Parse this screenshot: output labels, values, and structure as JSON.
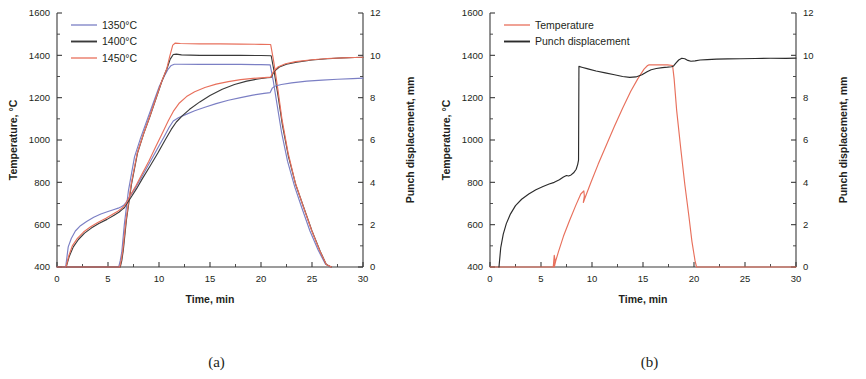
{
  "figure": {
    "panels": [
      {
        "id": "a",
        "caption": "(a)",
        "x_axis": {
          "label": "Time, min",
          "min": 0,
          "max": 30,
          "ticks": [
            0,
            5,
            10,
            15,
            20,
            25,
            30
          ]
        },
        "y_left": {
          "label": "Temperature, °C",
          "min": 400,
          "max": 1600,
          "ticks": [
            400,
            600,
            800,
            1000,
            1200,
            1400,
            1600
          ]
        },
        "y_right": {
          "label": "Punch displacement, mm",
          "min": 0,
          "max": 12,
          "ticks": [
            0,
            2,
            4,
            6,
            8,
            10,
            12
          ]
        },
        "legend": {
          "position": "top-left",
          "entries": [
            {
              "label": "1350°C",
              "color": "#7b7fc4"
            },
            {
              "label": "1400°C",
              "color": "#3a3a3a"
            },
            {
              "label": "1450°C",
              "color": "#e8705c"
            }
          ]
        }
      },
      {
        "id": "b",
        "caption": "(b)",
        "x_axis": {
          "label": "Time, min",
          "min": 0,
          "max": 30,
          "ticks": [
            0,
            5,
            10,
            15,
            20,
            25,
            30
          ]
        },
        "y_left": {
          "label": "Temperature, °C",
          "min": 400,
          "max": 1600,
          "ticks": [
            400,
            600,
            800,
            1000,
            1200,
            1400,
            1600
          ]
        },
        "y_right": {
          "label": "Punch displacement, mm",
          "min": 0,
          "max": 12,
          "ticks": [
            0,
            2,
            4,
            6,
            8,
            10,
            12
          ]
        },
        "legend": {
          "position": "top-left",
          "entries": [
            {
              "label": "Temperature",
              "color": "#e8705c"
            },
            {
              "label": "Punch displacement",
              "color": "#2b2b2b"
            }
          ]
        }
      }
    ]
  },
  "chart_data": [
    {
      "type": "line",
      "panel": "a",
      "title": "",
      "xlabel": "Time, min",
      "ylabel": "Temperature, °C",
      "ylabel_right": "Punch displacement, mm",
      "xlim": [
        0,
        30
      ],
      "ylim": [
        400,
        1600
      ],
      "ylim_right": [
        0,
        12
      ],
      "grid": false,
      "legend_position": "top-left",
      "series": [
        {
          "name": "1350°C temperature",
          "axis": "left",
          "color": "#7b7fc4",
          "x": [
            0,
            6.05,
            6.2,
            6.35,
            6.6,
            7.0,
            7.6,
            8.2,
            8.8,
            9.4,
            10.0,
            10.5,
            10.9,
            11.2,
            11.5,
            12.0,
            14.0,
            16.0,
            18.0,
            20.0,
            20.9,
            21.2,
            21.6,
            22.0,
            22.6,
            23.3,
            24.0,
            24.8,
            25.6,
            26.3,
            26.8
          ],
          "y": [
            400,
            400,
            430,
            470,
            600,
            760,
            920,
            1010,
            1090,
            1170,
            1250,
            1300,
            1335,
            1352,
            1358,
            1358,
            1357,
            1357,
            1357,
            1356,
            1355,
            1280,
            1160,
            1040,
            900,
            780,
            680,
            570,
            480,
            415,
            400
          ]
        },
        {
          "name": "1400°C temperature",
          "axis": "left",
          "color": "#3a3a3a",
          "x": [
            0,
            6.2,
            6.35,
            6.5,
            6.8,
            7.3,
            7.9,
            8.5,
            9.1,
            9.7,
            10.3,
            10.8,
            11.1,
            11.4,
            11.7,
            12.2,
            14.0,
            16.0,
            18.0,
            20.0,
            21.0,
            21.3,
            21.7,
            22.1,
            22.7,
            23.4,
            24.2,
            25.0,
            25.8,
            26.4,
            26.9
          ],
          "y": [
            400,
            400,
            430,
            480,
            620,
            790,
            940,
            1030,
            1110,
            1195,
            1280,
            1340,
            1382,
            1404,
            1406,
            1402,
            1400,
            1400,
            1400,
            1399,
            1398,
            1320,
            1200,
            1070,
            920,
            790,
            680,
            570,
            475,
            412,
            400
          ]
        },
        {
          "name": "1450°C temperature",
          "axis": "left",
          "color": "#e8705c",
          "x": [
            0,
            6.15,
            6.3,
            6.45,
            6.75,
            7.25,
            7.85,
            8.45,
            9.05,
            9.65,
            10.25,
            10.75,
            11.05,
            11.35,
            11.6,
            12.1,
            14.0,
            16.0,
            18.0,
            20.0,
            20.95,
            21.25,
            21.65,
            22.05,
            22.65,
            23.35,
            24.15,
            24.95,
            25.75,
            26.4,
            26.9
          ],
          "y": [
            400,
            400,
            432,
            478,
            615,
            785,
            935,
            1025,
            1105,
            1190,
            1275,
            1335,
            1395,
            1448,
            1458,
            1456,
            1454,
            1454,
            1453,
            1452,
            1451,
            1370,
            1240,
            1100,
            940,
            800,
            685,
            575,
            478,
            412,
            400
          ]
        },
        {
          "name": "1350°C punch displacement",
          "axis": "right",
          "color": "#7b7fc4",
          "x": [
            0.85,
            1.1,
            1.4,
            1.8,
            2.3,
            2.9,
            3.6,
            4.3,
            5.0,
            5.6,
            6.0,
            6.3,
            6.5,
            6.7,
            7.1,
            7.7,
            8.3,
            9.0,
            9.8,
            10.5,
            11.0,
            11.4,
            11.9,
            12.6,
            13.5,
            14.5,
            15.6,
            16.8,
            18.0,
            19.2,
            20.3,
            20.9,
            21.1,
            21.4,
            22.0,
            23.0,
            24.5,
            26.0,
            27.5,
            29.0,
            30.0
          ],
          "y": [
            0.0,
            0.95,
            1.35,
            1.7,
            1.95,
            2.15,
            2.35,
            2.5,
            2.62,
            2.72,
            2.78,
            2.85,
            2.9,
            3.0,
            3.3,
            3.75,
            4.25,
            4.85,
            5.55,
            6.15,
            6.6,
            6.9,
            7.05,
            7.2,
            7.38,
            7.55,
            7.72,
            7.88,
            8.0,
            8.12,
            8.2,
            8.24,
            8.45,
            8.55,
            8.62,
            8.7,
            8.78,
            8.83,
            8.87,
            8.9,
            8.92
          ]
        },
        {
          "name": "1400°C punch displacement",
          "axis": "right",
          "color": "#3a3a3a",
          "x": [
            0.9,
            1.2,
            1.6,
            2.1,
            2.7,
            3.4,
            4.1,
            4.9,
            5.6,
            6.1,
            6.4,
            6.6,
            6.8,
            7.2,
            7.8,
            8.4,
            9.1,
            9.9,
            10.6,
            11.2,
            11.7,
            12.3,
            13.0,
            14.0,
            15.0,
            16.2,
            17.4,
            18.6,
            19.7,
            20.6,
            21.0,
            21.3,
            21.8,
            22.5,
            23.5,
            25.0,
            26.5,
            28.0,
            29.2,
            30.0
          ],
          "y": [
            0.0,
            0.5,
            0.95,
            1.3,
            1.6,
            1.85,
            2.05,
            2.25,
            2.45,
            2.6,
            2.72,
            2.8,
            2.95,
            3.25,
            3.7,
            4.2,
            4.75,
            5.4,
            6.0,
            6.5,
            6.85,
            7.15,
            7.45,
            7.8,
            8.1,
            8.4,
            8.62,
            8.78,
            8.88,
            8.94,
            8.96,
            9.25,
            9.45,
            9.58,
            9.68,
            9.78,
            9.84,
            9.88,
            9.9,
            9.91
          ]
        },
        {
          "name": "1450°C punch displacement",
          "axis": "right",
          "color": "#e8705c",
          "x": [
            0.88,
            1.15,
            1.5,
            2.0,
            2.6,
            3.3,
            4.0,
            4.8,
            5.5,
            6.0,
            6.3,
            6.55,
            6.75,
            7.15,
            7.75,
            8.35,
            9.0,
            9.7,
            10.3,
            10.9,
            11.4,
            12.0,
            12.7,
            13.5,
            14.5,
            15.6,
            16.8,
            18.0,
            19.2,
            20.3,
            20.95,
            21.25,
            21.7,
            22.4,
            23.4,
            25.0,
            26.5,
            28.0,
            29.2,
            30.0
          ],
          "y": [
            0.0,
            0.52,
            1.0,
            1.35,
            1.65,
            1.9,
            2.1,
            2.3,
            2.5,
            2.65,
            2.75,
            2.85,
            3.0,
            3.35,
            3.85,
            4.4,
            5.0,
            5.7,
            6.3,
            6.9,
            7.35,
            7.75,
            8.05,
            8.28,
            8.48,
            8.64,
            8.76,
            8.85,
            8.91,
            8.95,
            8.97,
            9.26,
            9.46,
            9.6,
            9.7,
            9.79,
            9.85,
            9.88,
            9.9,
            9.91
          ]
        }
      ]
    },
    {
      "type": "line",
      "panel": "b",
      "title": "",
      "xlabel": "Time, min",
      "ylabel": "Temperature, °C",
      "ylabel_right": "Punch displacement, mm",
      "xlim": [
        0,
        30
      ],
      "ylim": [
        400,
        1600
      ],
      "ylim_right": [
        0,
        12
      ],
      "grid": false,
      "legend_position": "top-left",
      "series": [
        {
          "name": "Temperature",
          "axis": "left",
          "color": "#e8705c",
          "x": [
            0,
            6.2,
            6.3,
            6.38,
            6.3,
            6.45,
            6.7,
            7.2,
            7.8,
            8.4,
            8.9,
            9.2,
            9.25,
            9.15,
            9.3,
            9.9,
            10.6,
            11.4,
            12.2,
            13.0,
            13.8,
            14.5,
            15.1,
            15.45,
            15.6,
            16.5,
            17.4,
            17.9,
            18.05,
            18.3,
            18.7,
            19.1,
            19.5,
            19.8,
            20.1,
            20.25,
            30
          ],
          "y": [
            400,
            400,
            455,
            430,
            400,
            430,
            470,
            545,
            620,
            690,
            745,
            760,
            735,
            705,
            725,
            800,
            885,
            975,
            1065,
            1150,
            1230,
            1290,
            1335,
            1352,
            1355,
            1355,
            1355,
            1352,
            1290,
            1140,
            960,
            790,
            640,
            520,
            430,
            400,
            400
          ]
        },
        {
          "name": "Punch displacement",
          "axis": "right",
          "color": "#2b2b2b",
          "x": [
            0.88,
            1.05,
            1.3,
            1.6,
            2.0,
            2.5,
            3.1,
            3.8,
            4.5,
            5.2,
            5.8,
            6.3,
            6.8,
            7.2,
            7.5,
            7.7,
            7.95,
            8.2,
            8.45,
            8.6,
            8.68,
            8.72,
            9.0,
            9.6,
            10.4,
            11.3,
            12.2,
            13.0,
            13.7,
            14.3,
            14.9,
            15.4,
            15.8,
            16.3,
            16.9,
            17.4,
            17.8,
            18.0,
            18.2,
            18.5,
            18.8,
            19.1,
            19.4,
            19.7,
            20.1,
            20.6,
            21.3,
            22.2,
            23.3,
            24.6,
            26.0,
            27.5,
            29.0,
            30.0
          ],
          "y": [
            0.0,
            0.9,
            1.55,
            2.05,
            2.5,
            2.9,
            3.2,
            3.45,
            3.65,
            3.8,
            3.92,
            4.0,
            4.12,
            4.25,
            4.32,
            4.3,
            4.35,
            4.45,
            4.62,
            4.85,
            5.05,
            9.48,
            9.44,
            9.36,
            9.26,
            9.17,
            9.08,
            9.0,
            8.96,
            8.98,
            9.08,
            9.22,
            9.32,
            9.38,
            9.42,
            9.44,
            9.46,
            9.5,
            9.62,
            9.78,
            9.86,
            9.84,
            9.76,
            9.72,
            9.74,
            9.78,
            9.8,
            9.82,
            9.83,
            9.84,
            9.85,
            9.86,
            9.86,
            9.87
          ]
        }
      ]
    }
  ]
}
